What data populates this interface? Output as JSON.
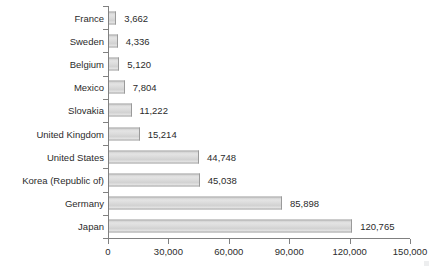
{
  "chart_data": {
    "type": "bar",
    "orientation": "horizontal",
    "title": "",
    "xlabel": "",
    "ylabel": "",
    "categories": [
      "France",
      "Sweden",
      "Belgium",
      "Mexico",
      "Slovakia",
      "United Kingdom",
      "United States",
      "Korea (Republic of)",
      "Germany",
      "Japan"
    ],
    "values": [
      3662,
      4336,
      5120,
      7804,
      11222,
      15214,
      44748,
      45038,
      85898,
      120765
    ],
    "value_labels": [
      "3,662",
      "4,336",
      "5,120",
      "7,804",
      "11,222",
      "15,214",
      "44,748",
      "45,038",
      "85,898",
      "120,765"
    ],
    "xlim": [
      0,
      150000
    ],
    "xticks": [
      0,
      30000,
      60000,
      90000,
      120000,
      150000
    ],
    "xtick_labels": [
      "0",
      "30,000",
      "60,000",
      "90,000",
      "120,000",
      "150,000"
    ],
    "grid": false,
    "legend": null,
    "bar_fill_color": "#dcdcdc",
    "bar_border_color": "#9a9a9a",
    "axis_color": "#808080",
    "text_color": "#2b2b2b",
    "background_color": "#ffffff"
  }
}
